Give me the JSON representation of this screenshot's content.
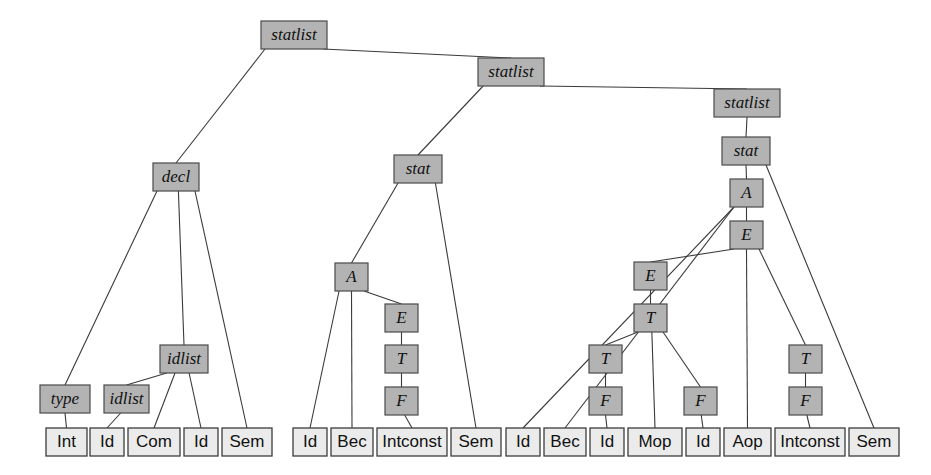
{
  "figure": {
    "colors": {
      "nonterminal_fill": "#b3b3b3",
      "nonterminal_stroke": "#4a4a4a",
      "terminal_fill": "#ebebeb",
      "terminal_stroke": "#3c3c3c",
      "edge": "#3a3a3a",
      "background": "#ffffff"
    },
    "legend": {
      "nonterminal_style": "grey filled box, italic label",
      "terminal_style": "light box, upright label"
    }
  },
  "nodes": [
    {
      "id": "statlist1",
      "label": "statlist",
      "kind": "nonterminal",
      "x": 261,
      "y": 21,
      "w": 66,
      "h": 28
    },
    {
      "id": "statlist2",
      "label": "statlist",
      "kind": "nonterminal",
      "x": 478,
      "y": 58,
      "w": 66,
      "h": 28
    },
    {
      "id": "statlist3",
      "label": "statlist",
      "kind": "nonterminal",
      "x": 714,
      "y": 89,
      "w": 66,
      "h": 28
    },
    {
      "id": "decl",
      "label": "decl",
      "kind": "nonterminal",
      "x": 153,
      "y": 163,
      "w": 46,
      "h": 28
    },
    {
      "id": "stat2",
      "label": "stat",
      "kind": "nonterminal",
      "x": 394,
      "y": 155,
      "w": 48,
      "h": 28
    },
    {
      "id": "stat3",
      "label": "stat",
      "kind": "nonterminal",
      "x": 722,
      "y": 137,
      "w": 48,
      "h": 28
    },
    {
      "id": "idlist_top",
      "label": "idlist",
      "kind": "nonterminal",
      "x": 160,
      "y": 345,
      "w": 48,
      "h": 28
    },
    {
      "id": "type",
      "label": "type",
      "kind": "nonterminal",
      "x": 40,
      "y": 385,
      "w": 50,
      "h": 28
    },
    {
      "id": "idlist_sub",
      "label": "idlist",
      "kind": "nonterminal",
      "x": 104,
      "y": 385,
      "w": 45,
      "h": 28
    },
    {
      "id": "A2",
      "label": "A",
      "kind": "nonterminal",
      "x": 335,
      "y": 263,
      "w": 33,
      "h": 28
    },
    {
      "id": "E2",
      "label": "E",
      "kind": "nonterminal",
      "x": 385,
      "y": 304,
      "w": 33,
      "h": 28
    },
    {
      "id": "T2",
      "label": "T",
      "kind": "nonterminal",
      "x": 385,
      "y": 345,
      "w": 33,
      "h": 28
    },
    {
      "id": "F2",
      "label": "F",
      "kind": "nonterminal",
      "x": 385,
      "y": 387,
      "w": 33,
      "h": 28
    },
    {
      "id": "A3",
      "label": "A",
      "kind": "nonterminal",
      "x": 730,
      "y": 179,
      "w": 33,
      "h": 28
    },
    {
      "id": "E3",
      "label": "E",
      "kind": "nonterminal",
      "x": 730,
      "y": 221,
      "w": 33,
      "h": 28
    },
    {
      "id": "E3b",
      "label": "E",
      "kind": "nonterminal",
      "x": 634,
      "y": 262,
      "w": 33,
      "h": 28
    },
    {
      "id": "T3",
      "label": "T",
      "kind": "nonterminal",
      "x": 634,
      "y": 304,
      "w": 33,
      "h": 28
    },
    {
      "id": "T3b",
      "label": "T",
      "kind": "nonterminal",
      "x": 589,
      "y": 345,
      "w": 33,
      "h": 28
    },
    {
      "id": "F3b",
      "label": "F",
      "kind": "nonterminal",
      "x": 589,
      "y": 387,
      "w": 33,
      "h": 28
    },
    {
      "id": "F3c",
      "label": "F",
      "kind": "nonterminal",
      "x": 684,
      "y": 387,
      "w": 33,
      "h": 28
    },
    {
      "id": "T3c",
      "label": "T",
      "kind": "nonterminal",
      "x": 789,
      "y": 345,
      "w": 33,
      "h": 28
    },
    {
      "id": "F3d",
      "label": "F",
      "kind": "nonterminal",
      "x": 789,
      "y": 387,
      "w": 33,
      "h": 28
    },
    {
      "id": "L_int",
      "label": "Int",
      "kind": "terminal",
      "x": 46,
      "y": 428,
      "w": 41,
      "h": 28
    },
    {
      "id": "L_id1",
      "label": "Id",
      "kind": "terminal",
      "x": 90,
      "y": 428,
      "w": 34,
      "h": 28
    },
    {
      "id": "L_com",
      "label": "Com",
      "kind": "terminal",
      "x": 128,
      "y": 428,
      "w": 52,
      "h": 28
    },
    {
      "id": "L_id2",
      "label": "Id",
      "kind": "terminal",
      "x": 184,
      "y": 428,
      "w": 34,
      "h": 28
    },
    {
      "id": "L_sem1",
      "label": "Sem",
      "kind": "terminal",
      "x": 222,
      "y": 428,
      "w": 50,
      "h": 28
    },
    {
      "id": "L_id3",
      "label": "Id",
      "kind": "terminal",
      "x": 293,
      "y": 428,
      "w": 34,
      "h": 28
    },
    {
      "id": "L_bec1",
      "label": "Bec",
      "kind": "terminal",
      "x": 331,
      "y": 428,
      "w": 42,
      "h": 28
    },
    {
      "id": "L_intconst1",
      "label": "Intconst",
      "kind": "terminal",
      "x": 377,
      "y": 428,
      "w": 70,
      "h": 28
    },
    {
      "id": "L_sem2",
      "label": "Sem",
      "kind": "terminal",
      "x": 451,
      "y": 428,
      "w": 50,
      "h": 28
    },
    {
      "id": "L_id4",
      "label": "Id",
      "kind": "terminal",
      "x": 506,
      "y": 428,
      "w": 34,
      "h": 28
    },
    {
      "id": "L_bec2",
      "label": "Bec",
      "kind": "terminal",
      "x": 544,
      "y": 428,
      "w": 42,
      "h": 28
    },
    {
      "id": "L_id5",
      "label": "Id",
      "kind": "terminal",
      "x": 590,
      "y": 428,
      "w": 34,
      "h": 28
    },
    {
      "id": "L_mop",
      "label": "Mop",
      "kind": "terminal",
      "x": 628,
      "y": 428,
      "w": 54,
      "h": 28
    },
    {
      "id": "L_id6",
      "label": "Id",
      "kind": "terminal",
      "x": 686,
      "y": 428,
      "w": 34,
      "h": 28
    },
    {
      "id": "L_aop",
      "label": "Aop",
      "kind": "terminal",
      "x": 724,
      "y": 428,
      "w": 47,
      "h": 28
    },
    {
      "id": "L_intconst2",
      "label": "Intconst",
      "kind": "terminal",
      "x": 775,
      "y": 428,
      "w": 70,
      "h": 28
    },
    {
      "id": "L_sem3",
      "label": "Sem",
      "kind": "terminal",
      "x": 849,
      "y": 428,
      "w": 50,
      "h": 28
    }
  ],
  "edges": [
    {
      "from": "statlist1",
      "to": "decl"
    },
    {
      "from": "statlist1",
      "to": "statlist2"
    },
    {
      "from": "statlist2",
      "to": "stat2"
    },
    {
      "from": "statlist2",
      "to": "statlist3"
    },
    {
      "from": "statlist3",
      "to": "stat3"
    },
    {
      "from": "decl",
      "to": "type"
    },
    {
      "from": "decl",
      "to": "idlist_top"
    },
    {
      "from": "decl",
      "to": "L_sem1"
    },
    {
      "from": "idlist_top",
      "to": "idlist_sub"
    },
    {
      "from": "idlist_top",
      "to": "L_com"
    },
    {
      "from": "idlist_top",
      "to": "L_id2"
    },
    {
      "from": "idlist_sub",
      "to": "L_id1"
    },
    {
      "from": "type",
      "to": "L_int"
    },
    {
      "from": "stat2",
      "to": "A2"
    },
    {
      "from": "stat2",
      "to": "L_sem2"
    },
    {
      "from": "A2",
      "to": "L_id3"
    },
    {
      "from": "A2",
      "to": "L_bec1"
    },
    {
      "from": "A2",
      "to": "E2"
    },
    {
      "from": "E2",
      "to": "T2"
    },
    {
      "from": "T2",
      "to": "F2"
    },
    {
      "from": "F2",
      "to": "L_intconst1"
    },
    {
      "from": "stat3",
      "to": "A3"
    },
    {
      "from": "stat3",
      "to": "L_sem3"
    },
    {
      "from": "A3",
      "to": "L_id4"
    },
    {
      "from": "A3",
      "to": "L_bec2"
    },
    {
      "from": "A3",
      "to": "E3"
    },
    {
      "from": "E3",
      "to": "E3b"
    },
    {
      "from": "E3",
      "to": "L_aop"
    },
    {
      "from": "E3",
      "to": "T3c"
    },
    {
      "from": "E3b",
      "to": "T3"
    },
    {
      "from": "T3",
      "to": "T3b"
    },
    {
      "from": "T3",
      "to": "L_mop"
    },
    {
      "from": "T3",
      "to": "F3c"
    },
    {
      "from": "T3b",
      "to": "F3b"
    },
    {
      "from": "F3b",
      "to": "L_id5"
    },
    {
      "from": "F3c",
      "to": "L_id6"
    },
    {
      "from": "T3c",
      "to": "F3d"
    },
    {
      "from": "F3d",
      "to": "L_intconst2"
    }
  ]
}
